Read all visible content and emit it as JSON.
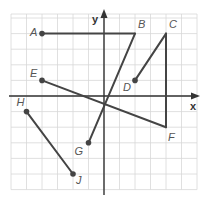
{
  "diagram": {
    "type": "coordinate-plane",
    "axes": {
      "x_label": "x",
      "y_label": "y"
    },
    "grid": {
      "x_min": -6,
      "x_max": 6,
      "y_min": -6,
      "y_max": 5,
      "step": 1
    },
    "points": [
      {
        "name": "A",
        "x": -4,
        "y": 4
      },
      {
        "name": "B",
        "x": 2,
        "y": 4
      },
      {
        "name": "C",
        "x": 4,
        "y": 4
      },
      {
        "name": "D",
        "x": 2,
        "y": 1
      },
      {
        "name": "E",
        "x": -4,
        "y": 1
      },
      {
        "name": "F",
        "x": 4,
        "y": -2
      },
      {
        "name": "G",
        "x": -1,
        "y": -3
      },
      {
        "name": "H",
        "x": -5,
        "y": -1
      },
      {
        "name": "J",
        "x": -2,
        "y": -5
      }
    ],
    "segments": [
      {
        "from": "A",
        "to": "B",
        "dot_from": true,
        "dot_to": false
      },
      {
        "from": "B",
        "to": "G",
        "dot_from": false,
        "dot_to": true
      },
      {
        "from": "C",
        "to": "D",
        "dot_from": false,
        "dot_to": true
      },
      {
        "from": "C",
        "to": "F",
        "dot_from": false,
        "dot_to": false
      },
      {
        "from": "E",
        "to": "F",
        "dot_from": true,
        "dot_to": false
      },
      {
        "from": "H",
        "to": "J",
        "dot_from": true,
        "dot_to": true
      }
    ],
    "labels": {
      "A": {
        "dx": -12,
        "dy": 2
      },
      "B": {
        "dx": 3,
        "dy": -6
      },
      "C": {
        "dx": 3,
        "dy": -6
      },
      "D": {
        "dx": -12,
        "dy": 11
      },
      "E": {
        "dx": -12,
        "dy": -3
      },
      "F": {
        "dx": 2,
        "dy": 14
      },
      "G": {
        "dx": -14,
        "dy": 12
      },
      "H": {
        "dx": -10,
        "dy": -6
      },
      "J": {
        "dx": 3,
        "dy": 10
      }
    }
  }
}
